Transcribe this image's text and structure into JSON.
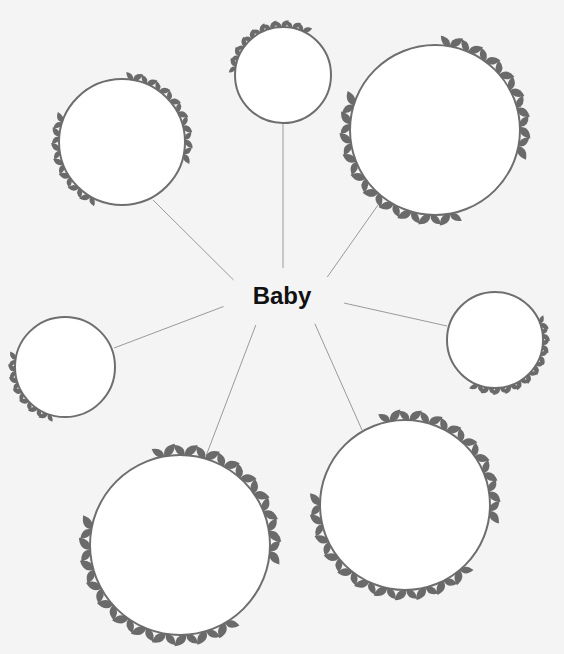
{
  "diagram": {
    "type": "mind-map",
    "center": {
      "label": "Baby",
      "x": 283,
      "y": 298
    },
    "colors": {
      "background": "#f4f4f4",
      "ring": "#6e6e6e",
      "leaf": "#6a6a6a",
      "connector": "#9a9a9a",
      "fill": "#ffffff"
    },
    "nodes": [
      {
        "id": "top",
        "label": "",
        "cx": 283,
        "cy": 75,
        "r": 48,
        "lx": 283,
        "ly": 123
      },
      {
        "id": "top-left",
        "label": "",
        "cx": 122,
        "cy": 142,
        "r": 63,
        "lx": 153,
        "ly": 200
      },
      {
        "id": "top-right",
        "label": "",
        "cx": 435,
        "cy": 130,
        "r": 85,
        "lx": 378,
        "ly": 205
      },
      {
        "id": "left",
        "label": "",
        "cx": 65,
        "cy": 367,
        "r": 50,
        "lx": 114,
        "ly": 348
      },
      {
        "id": "right",
        "label": "",
        "cx": 495,
        "cy": 340,
        "r": 48,
        "lx": 447,
        "ly": 326
      },
      {
        "id": "bottom-left",
        "label": "",
        "cx": 180,
        "cy": 545,
        "r": 90,
        "lx": 206,
        "ly": 456
      },
      {
        "id": "bottom-right",
        "label": "",
        "cx": 405,
        "cy": 505,
        "r": 85,
        "lx": 362,
        "ly": 430
      }
    ]
  }
}
